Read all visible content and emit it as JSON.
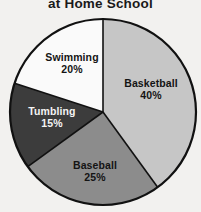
{
  "chart_data": {
    "type": "pie",
    "title": "at Home School",
    "xlabel": "",
    "ylabel": "",
    "legend": "none",
    "grid": false,
    "units": "percent",
    "start_angle_deg": 0,
    "direction": "clockwise",
    "categories": [
      "Basketball",
      "Baseball",
      "Tumbling",
      "Swimming"
    ],
    "values": [
      40,
      25,
      15,
      20
    ],
    "labels": [
      "Basketball 40%",
      "Baseball 25%",
      "Tumbling 15%",
      "Swimming 20%"
    ],
    "slices": [
      {
        "name": "Basketball",
        "value": 40,
        "value_text": "40%",
        "color": "#c6c6c6",
        "text_color": "#141414",
        "start_deg": 0,
        "end_deg": 144
      },
      {
        "name": "Baseball",
        "value": 25,
        "value_text": "25%",
        "color": "#8c8c8c",
        "text_color": "#141414",
        "start_deg": 144,
        "end_deg": 234
      },
      {
        "name": "Tumbling",
        "value": 15,
        "value_text": "15%",
        "color": "#3c3c3c",
        "text_color": "#f4f4f4",
        "start_deg": 234,
        "end_deg": 288
      },
      {
        "name": "Swimming",
        "value": 20,
        "value_text": "20%",
        "color": "#fafafa",
        "text_color": "#141414",
        "start_deg": 288,
        "end_deg": 360
      }
    ]
  },
  "style": {
    "background": "#f2f1ef",
    "outline": "#111111",
    "divider": "#111111"
  }
}
